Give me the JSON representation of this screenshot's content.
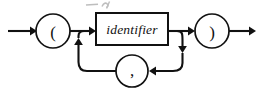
{
  "diagram": {
    "type": "railroad-syntax-diagram",
    "title": "",
    "background_color": "#ffffff",
    "line_color": "#111111",
    "width": 261,
    "height": 88,
    "main_line_y": 31,
    "loop_line_y": 71,
    "nodes": [
      {
        "id": "entry-arrow",
        "kind": "arrow",
        "label": "",
        "x1": 8,
        "x2": 36,
        "y": 31,
        "direction": "right"
      },
      {
        "id": "open-paren",
        "kind": "terminal-circle",
        "label": "(",
        "cx": 53,
        "cy": 31,
        "r": 17
      },
      {
        "id": "identifier",
        "kind": "nonterminal-box",
        "label": "identifier",
        "x": 96,
        "y": 13,
        "width": 72,
        "height": 32,
        "style": "italic"
      },
      {
        "id": "comma",
        "kind": "terminal-circle",
        "label": ",",
        "cx": 132,
        "cy": 71,
        "r": 16
      },
      {
        "id": "close-paren",
        "kind": "terminal-circle",
        "label": ")",
        "cx": 212,
        "cy": 31,
        "r": 17
      },
      {
        "id": "exit-arrow",
        "kind": "arrow",
        "label": "",
        "x1": 229,
        "x2": 256,
        "y": 31,
        "direction": "right"
      }
    ],
    "edges": [
      {
        "id": "entry-to-open-paren",
        "from": "entry",
        "to": "open-paren",
        "arrow": true
      },
      {
        "id": "open-paren-to-identifier",
        "from": "open-paren",
        "to": "identifier",
        "arrow": true
      },
      {
        "id": "identifier-to-close-paren",
        "from": "identifier",
        "to": "close-paren",
        "arrow": true
      },
      {
        "id": "close-paren-to-exit",
        "from": "close-paren",
        "to": "exit",
        "arrow": true
      },
      {
        "id": "identifier-down-to-comma",
        "from": "identifier",
        "to": "comma",
        "arrow": true,
        "direction": "down-left"
      },
      {
        "id": "comma-up-to-identifier",
        "from": "comma",
        "to": "identifier",
        "arrow": true,
        "direction": "left-up"
      }
    ]
  },
  "artifact": {
    "description": "clipped-text-fragment",
    "label": ""
  }
}
